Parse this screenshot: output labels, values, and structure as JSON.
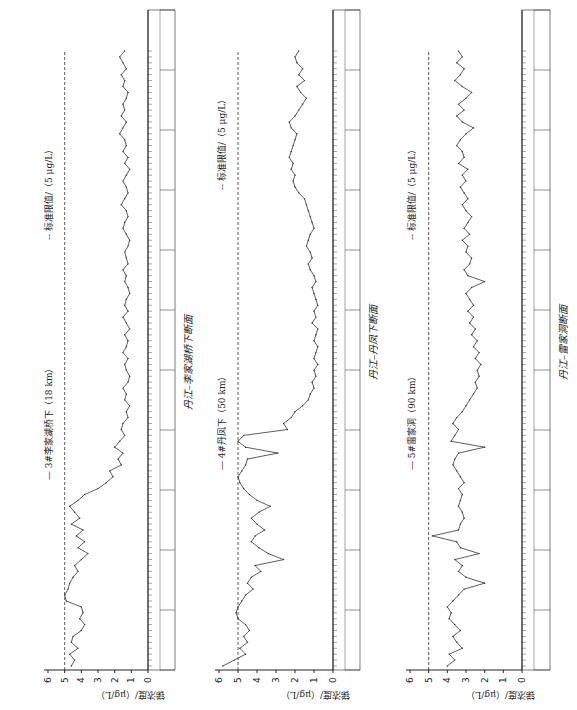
{
  "figure": {
    "y_axis_label": "锑浓度/（μg/L）",
    "y_ticks": [
      "0",
      "1",
      "2",
      "3",
      "4",
      "5",
      "6"
    ],
    "standard_limit_legend": "-- 标准限值/（5 μg/L）",
    "colors": {
      "line": "#333333",
      "limit": "#333333",
      "axis": "#222222"
    }
  },
  "panels": [
    {
      "station_legend": "— 3#李家湖桥下（18 km）",
      "limit_legend": "-- 标准限值/（5 μg/L）",
      "caption": "丹江–李家湖桥下断面"
    },
    {
      "station_legend": "— 4#丹凤下（50 km）",
      "limit_legend": "-- 标准限值/（5 μg/L）",
      "caption": "丹江–丹凤下断面"
    },
    {
      "station_legend": "— 5#雷家洞（90 km）",
      "limit_legend": "-- 标准限值/（5 μg/L）",
      "caption": "丹江–雷家洞断面"
    }
  ],
  "chart_data": [
    {
      "type": "line",
      "title": "丹江–李家湖桥下断面",
      "series": [
        {
          "name": "3#李家湖桥下（18 km）",
          "values": [
            4.6,
            4.4,
            4.7,
            4.2,
            4.6,
            4.5,
            4.0,
            3.8,
            4.1,
            3.9,
            4.0,
            4.9,
            5.0,
            4.8,
            4.7,
            4.5,
            4.2,
            4.4,
            4.0,
            3.6,
            4.2,
            3.8,
            4.3,
            3.9,
            4.6,
            4.1,
            4.4,
            4.7,
            4.2,
            3.8,
            3.0,
            2.5,
            2.1,
            2.3,
            1.6,
            1.8,
            1.5,
            2.0,
            1.7,
            1.4,
            1.6,
            1.5,
            1.2,
            1.3,
            1.1,
            1.4,
            1.3,
            1.5,
            1.2,
            1.1,
            1.3,
            1.4,
            1.2,
            1.5,
            1.3,
            1.2,
            1.4,
            1.1,
            1.3,
            1.5,
            1.2,
            1.4,
            1.3,
            1.1,
            1.2,
            1.4,
            1.3,
            1.5,
            1.2,
            1.3,
            1.4,
            1.2,
            1.1,
            1.3,
            1.5,
            1.4,
            1.2,
            1.3,
            1.6,
            1.4,
            1.2,
            1.3,
            1.5,
            1.3,
            1.1,
            1.4,
            1.2,
            1.5,
            1.3,
            1.4,
            1.7,
            1.5,
            1.3,
            1.6,
            1.4,
            1.5,
            1.3,
            1.2,
            1.5,
            1.4,
            1.6,
            1.3,
            1.5,
            1.7,
            1.4
          ]
        },
        {
          "name": "标准限值",
          "values": [
            5
          ]
        }
      ],
      "ylabel": "锑浓度/（μg/L）",
      "ylim": [
        0,
        6
      ],
      "legend": [
        "3#李家湖桥下（18 km）",
        "标准限值/（5 μg/L）"
      ]
    },
    {
      "type": "line",
      "title": "丹江–丹凤下断面",
      "series": [
        {
          "name": "4#丹凤下（50 km）",
          "values": [
            5.8,
            5.2,
            4.6,
            4.9,
            4.5,
            4.7,
            4.4,
            4.6,
            5.0,
            5.1,
            5.0,
            4.8,
            4.6,
            4.2,
            4.5,
            4.3,
            3.8,
            4.1,
            2.6,
            3.4,
            3.9,
            4.3,
            4.1,
            3.6,
            4.0,
            4.3,
            3.9,
            3.3,
            4.0,
            4.4,
            4.7,
            4.9,
            5.0,
            4.8,
            4.6,
            4.5,
            2.9,
            4.6,
            5.0,
            4.7,
            2.4,
            2.6,
            2.2,
            2.0,
            1.6,
            1.3,
            1.2,
            1.0,
            1.1,
            0.9,
            1.0,
            0.8,
            1.0,
            0.9,
            0.8,
            1.0,
            0.9,
            0.8,
            1.1,
            0.9,
            1.0,
            0.8,
            0.9,
            1.0,
            1.1,
            0.9,
            1.0,
            1.2,
            1.3,
            1.1,
            1.2,
            1.4,
            1.3,
            1.2,
            1.0,
            1.1,
            1.2,
            1.3,
            1.4,
            1.5,
            1.8,
            2.0,
            2.1,
            2.0,
            2.2,
            2.1,
            2.3,
            2.2,
            2.1,
            2.0,
            1.9,
            2.2,
            2.3,
            2.0,
            1.8,
            1.6,
            1.4,
            1.7,
            1.9,
            1.5,
            1.8,
            1.6,
            1.9,
            2.0,
            1.8
          ]
        },
        {
          "name": "标准限值",
          "values": [
            5
          ]
        }
      ],
      "ylabel": "锑浓度/（μg/L）",
      "ylim": [
        0,
        6
      ],
      "legend": [
        "4#丹凤下（50 km）",
        "标准限值/（5 μg/L）"
      ]
    },
    {
      "type": "line",
      "title": "丹江–雷家洞断面",
      "series": [
        {
          "name": "5#雷家洞（90 km）",
          "values": [
            4.0,
            3.6,
            3.9,
            3.2,
            3.5,
            3.7,
            3.3,
            3.6,
            3.9,
            3.8,
            4.0,
            3.7,
            3.4,
            3.1,
            2.0,
            3.0,
            3.4,
            3.2,
            3.6,
            2.3,
            3.3,
            3.5,
            4.8,
            3.4,
            3.3,
            3.1,
            3.2,
            3.4,
            3.3,
            3.2,
            3.4,
            3.1,
            3.3,
            3.5,
            3.7,
            3.6,
            3.4,
            2.0,
            3.8,
            3.6,
            3.4,
            3.7,
            3.5,
            3.2,
            3.0,
            2.8,
            2.6,
            2.4,
            2.5,
            2.3,
            2.4,
            2.2,
            2.5,
            2.3,
            2.6,
            2.4,
            2.7,
            2.5,
            2.8,
            2.6,
            2.9,
            2.6,
            2.8,
            3.0,
            2.7,
            2.0,
            2.9,
            3.1,
            2.8,
            2.7,
            3.0,
            2.9,
            3.2,
            2.8,
            3.1,
            2.9,
            2.7,
            3.0,
            3.2,
            2.9,
            3.1,
            3.3,
            3.0,
            3.2,
            2.9,
            3.4,
            3.1,
            3.2,
            3.5,
            3.3,
            3.0,
            2.6,
            3.2,
            3.5,
            3.1,
            3.4,
            3.0,
            2.7,
            3.2,
            3.6,
            3.3,
            3.1,
            3.5,
            3.2,
            3.4
          ]
        },
        {
          "name": "标准限值",
          "values": [
            5
          ]
        }
      ],
      "ylabel": "锑浓度/（μg/L）",
      "ylim": [
        0,
        6
      ],
      "legend": [
        "5#雷家洞（90 km）",
        "标准限值/（5 μg/L）"
      ]
    }
  ]
}
